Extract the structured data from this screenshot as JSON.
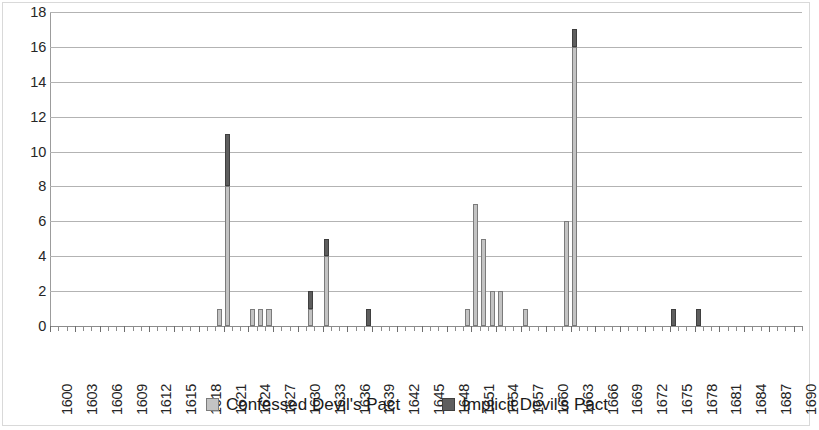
{
  "chart_data": {
    "type": "bar",
    "stacked": true,
    "title": "",
    "subtitle": "",
    "xlabel": "",
    "ylabel": "",
    "xlim": [
      1600,
      1691
    ],
    "ylim": [
      0,
      18
    ],
    "y_ticks": [
      0,
      2,
      4,
      6,
      8,
      10,
      12,
      14,
      16,
      18
    ],
    "x_tick_labels": [
      "1600",
      "1603",
      "1606",
      "1609",
      "1612",
      "1615",
      "1618",
      "1621",
      "1624",
      "1627",
      "1630",
      "1633",
      "1636",
      "1639",
      "1642",
      "1645",
      "1648",
      "1651",
      "1654",
      "1657",
      "1660",
      "1663",
      "1666",
      "1669",
      "1672",
      "1675",
      "1678",
      "1681",
      "1684",
      "1687",
      "1690"
    ],
    "x_tick_step": 3,
    "x_minor_step": 1,
    "grid": "horizontal",
    "legend_position": "bottom",
    "categories": [
      1600,
      1601,
      1602,
      1603,
      1604,
      1605,
      1606,
      1607,
      1608,
      1609,
      1610,
      1611,
      1612,
      1613,
      1614,
      1615,
      1616,
      1617,
      1618,
      1619,
      1620,
      1621,
      1622,
      1623,
      1624,
      1625,
      1626,
      1627,
      1628,
      1629,
      1630,
      1631,
      1632,
      1633,
      1634,
      1635,
      1636,
      1637,
      1638,
      1639,
      1640,
      1641,
      1642,
      1643,
      1644,
      1645,
      1646,
      1647,
      1648,
      1649,
      1650,
      1651,
      1652,
      1653,
      1654,
      1655,
      1656,
      1657,
      1658,
      1659,
      1660,
      1661,
      1662,
      1663,
      1664,
      1665,
      1666,
      1667,
      1668,
      1669,
      1670,
      1671,
      1672,
      1673,
      1674,
      1675,
      1676,
      1677,
      1678,
      1679,
      1680,
      1681,
      1682,
      1683,
      1684,
      1685,
      1686,
      1687,
      1688,
      1689,
      1690
    ],
    "series": [
      {
        "name": "Confessed Devil's Pact",
        "color": "#c3c3c3",
        "values": [
          0,
          0,
          0,
          0,
          0,
          0,
          0,
          0,
          0,
          0,
          0,
          0,
          0,
          0,
          0,
          0,
          0,
          0,
          0,
          0,
          1,
          8,
          0,
          0,
          1,
          1,
          1,
          0,
          0,
          0,
          0,
          1,
          0,
          4,
          0,
          0,
          0,
          0,
          0,
          0,
          0,
          0,
          0,
          0,
          0,
          0,
          0,
          0,
          0,
          0,
          1,
          7,
          5,
          2,
          2,
          0,
          0,
          1,
          0,
          0,
          0,
          0,
          6,
          16,
          0,
          0,
          0,
          0,
          0,
          0,
          0,
          0,
          0,
          0,
          0,
          0,
          0,
          0,
          0,
          0,
          0,
          0,
          0,
          0,
          0,
          0,
          0,
          0,
          0,
          0,
          0
        ]
      },
      {
        "name": "Implicit Devil's Pact",
        "color": "#5e5e5e",
        "values": [
          0,
          0,
          0,
          0,
          0,
          0,
          0,
          0,
          0,
          0,
          0,
          0,
          0,
          0,
          0,
          0,
          0,
          0,
          0,
          0,
          0,
          3,
          0,
          0,
          0,
          0,
          0,
          0,
          0,
          0,
          0,
          1,
          0,
          1,
          0,
          0,
          0,
          0,
          1,
          0,
          0,
          0,
          0,
          0,
          0,
          0,
          0,
          0,
          0,
          0,
          0,
          0,
          0,
          0,
          0,
          0,
          0,
          0,
          0,
          0,
          0,
          0,
          0,
          1,
          0,
          0,
          0,
          0,
          0,
          0,
          0,
          0,
          0,
          0,
          0,
          1,
          0,
          0,
          1,
          0,
          0,
          0,
          0,
          0,
          0,
          0,
          0,
          0,
          0,
          0,
          0
        ]
      }
    ],
    "totals": [
      0,
      0,
      0,
      0,
      0,
      0,
      0,
      0,
      0,
      0,
      0,
      0,
      0,
      0,
      0,
      0,
      0,
      0,
      0,
      0,
      1,
      11,
      0,
      0,
      1,
      1,
      1,
      0,
      0,
      0,
      0,
      2,
      0,
      5,
      0,
      0,
      0,
      0,
      1,
      0,
      0,
      0,
      0,
      0,
      0,
      0,
      0,
      0,
      0,
      0,
      1,
      7,
      5,
      2,
      2,
      0,
      0,
      1,
      0,
      0,
      0,
      0,
      6,
      17,
      0,
      0,
      0,
      0,
      0,
      0,
      0,
      0,
      0,
      0,
      0,
      1,
      0,
      0,
      1,
      0,
      0,
      0,
      0,
      0,
      0,
      0,
      0,
      0,
      0,
      0,
      0
    ]
  },
  "legend": {
    "entries": [
      {
        "label": "Confessed Devil's Pact",
        "swatch": "confessed"
      },
      {
        "label": "Implicit Devil's Pact",
        "swatch": "implicit"
      }
    ]
  },
  "colors": {
    "confessed": "#c3c3c3",
    "implicit": "#5e5e5e",
    "gridline": "#b3b3b3",
    "axis": "#8c8c8c",
    "text": "#262626"
  }
}
